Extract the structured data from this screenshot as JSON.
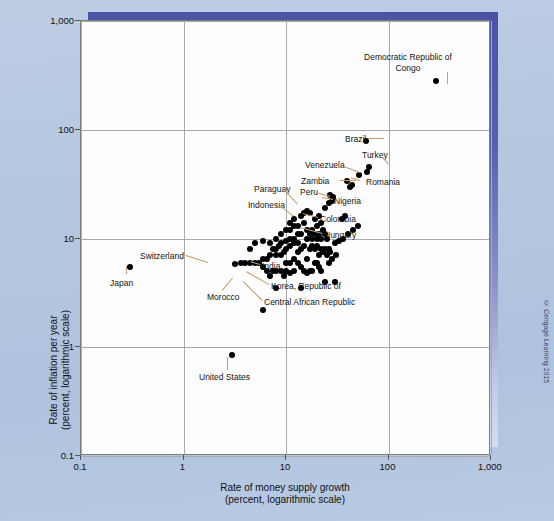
{
  "figure": {
    "copyright": "© Cengage Learning 2015"
  },
  "chart_data": {
    "type": "scatter",
    "title": "",
    "xlabel": "Rate of money supply growth\n(percent, logarithmic scale)",
    "xlabel_line1": "Rate of money supply growth",
    "xlabel_line2": "(percent, logarithmic scale)",
    "ylabel_line1": "Rate of inflation per year",
    "ylabel_line2": "(percent, logarithmic scale)",
    "xscale": "log",
    "yscale": "log",
    "xlim": [
      0.1,
      1000
    ],
    "ylim": [
      0.1,
      1000
    ],
    "grid": true,
    "legend": "none",
    "xticks": [
      "0.1",
      "1",
      "10",
      "100",
      "1,000"
    ],
    "xtick_values": [
      0.1,
      1,
      10,
      100,
      1000
    ],
    "yticks": [
      "1,000",
      "100",
      "10",
      "1",
      "0.1"
    ],
    "ytick_values": [
      1000,
      100,
      10,
      1,
      0.1
    ],
    "labeled_points": [
      {
        "name": "Democratic Republic of Congo",
        "x": 290,
        "y": 280
      },
      {
        "name": "Brazil",
        "x": 61,
        "y": 78
      },
      {
        "name": "Turkey",
        "x": 64,
        "y": 45
      },
      {
        "name": "Romania",
        "x": 52,
        "y": 38
      },
      {
        "name": "Venezuela",
        "x": 39,
        "y": 34
      },
      {
        "name": "Zambia",
        "x": 42,
        "y": 30
      },
      {
        "name": "Peru",
        "x": 27,
        "y": 25
      },
      {
        "name": "Nigeria",
        "x": 28,
        "y": 22
      },
      {
        "name": "Paraguay",
        "x": 17,
        "y": 17
      },
      {
        "name": "Indonesia",
        "x": 15,
        "y": 14
      },
      {
        "name": "Colombia",
        "x": 21,
        "y": 16
      },
      {
        "name": "Hungary",
        "x": 20,
        "y": 13
      },
      {
        "name": "India",
        "x": 13,
        "y": 7.5
      },
      {
        "name": "Korea, Republic of",
        "x": 16,
        "y": 6.5
      },
      {
        "name": "Central African Republic",
        "x": 9.5,
        "y": 4.5
      },
      {
        "name": "Morocco",
        "x": 7.5,
        "y": 5.0
      },
      {
        "name": "Switzerland",
        "x": 3.6,
        "y": 6.0
      },
      {
        "name": "Japan",
        "x": 0.3,
        "y": 5.5
      },
      {
        "name": "United States",
        "x": 3.0,
        "y": 0.85
      }
    ],
    "annotations": [
      {
        "text": "Democratic Republic of",
        "px": 408,
        "py": 52,
        "align": "center",
        "width": 110
      },
      {
        "text": "Congo",
        "px": 408,
        "py": 63,
        "align": "center",
        "width": 110
      },
      {
        "text": "Brazil",
        "px": 345,
        "py": 134
      },
      {
        "text": "Turkey",
        "px": 362,
        "py": 150
      },
      {
        "text": "Venezuela",
        "px": 305,
        "py": 160
      },
      {
        "text": "Romania",
        "px": 366,
        "py": 177
      },
      {
        "text": "Zambia",
        "px": 301,
        "py": 176
      },
      {
        "text": "Peru",
        "px": 300,
        "py": 187
      },
      {
        "text": "Nigeria",
        "px": 334,
        "py": 196
      },
      {
        "text": "Paraguay",
        "px": 254,
        "py": 184
      },
      {
        "text": "Indonesia",
        "px": 248,
        "py": 200
      },
      {
        "text": "Colombia",
        "px": 320,
        "py": 214
      },
      {
        "text": "Hungary",
        "px": 324,
        "py": 230
      },
      {
        "text": "Switzerland",
        "px": 140,
        "py": 251
      },
      {
        "text": "India",
        "px": 262,
        "py": 261
      },
      {
        "text": "Japan",
        "px": 110,
        "py": 278
      },
      {
        "text": "Korea, Republic of",
        "px": 271,
        "py": 281
      },
      {
        "text": "Morocco",
        "px": 207,
        "py": 292
      },
      {
        "text": "Central African Republic",
        "px": 264,
        "py": 297
      },
      {
        "text": "United States",
        "px": 199,
        "py": 372
      }
    ],
    "points": [
      [
        290,
        280
      ],
      [
        61,
        78
      ],
      [
        64,
        45
      ],
      [
        62,
        41
      ],
      [
        52,
        38
      ],
      [
        39,
        34
      ],
      [
        42,
        30
      ],
      [
        44,
        31
      ],
      [
        27,
        25
      ],
      [
        29,
        24
      ],
      [
        28,
        22
      ],
      [
        26,
        21
      ],
      [
        24,
        19
      ],
      [
        17,
        17
      ],
      [
        15,
        14
      ],
      [
        21,
        16
      ],
      [
        20,
        13
      ],
      [
        19,
        15
      ],
      [
        18,
        12
      ],
      [
        16,
        12
      ],
      [
        22,
        14
      ],
      [
        23,
        12
      ],
      [
        14,
        11
      ],
      [
        13,
        11
      ],
      [
        12,
        10
      ],
      [
        11,
        10
      ],
      [
        10,
        9.5
      ],
      [
        9,
        9
      ],
      [
        8.5,
        8.5
      ],
      [
        8,
        8
      ],
      [
        7.5,
        8
      ],
      [
        16,
        10
      ],
      [
        17,
        11
      ],
      [
        18,
        10
      ],
      [
        19,
        11
      ],
      [
        20,
        10
      ],
      [
        21,
        11
      ],
      [
        22,
        10
      ],
      [
        24,
        11
      ],
      [
        25,
        10
      ],
      [
        13,
        9
      ],
      [
        12,
        9
      ],
      [
        11,
        8.5
      ],
      [
        10,
        8
      ],
      [
        9.5,
        7.5
      ],
      [
        9,
        7
      ],
      [
        8,
        7
      ],
      [
        7,
        7
      ],
      [
        6.5,
        6.5
      ],
      [
        6,
        6.5
      ],
      [
        5.5,
        6
      ],
      [
        5,
        6
      ],
      [
        4.5,
        6
      ],
      [
        4,
        6
      ],
      [
        3.6,
        6
      ],
      [
        3.2,
        5.8
      ],
      [
        13,
        7.5
      ],
      [
        16,
        6.5
      ],
      [
        9.5,
        4.5
      ],
      [
        7.5,
        5
      ],
      [
        0.3,
        5.5
      ],
      [
        3,
        0.85
      ],
      [
        14,
        8
      ],
      [
        15,
        8.5
      ],
      [
        17,
        8
      ],
      [
        18,
        8.5
      ],
      [
        19,
        8
      ],
      [
        20,
        8.5
      ],
      [
        22,
        8
      ],
      [
        24,
        8
      ],
      [
        26,
        8
      ],
      [
        30,
        9
      ],
      [
        33,
        9.5
      ],
      [
        36,
        10
      ],
      [
        40,
        11
      ],
      [
        45,
        12
      ],
      [
        50,
        13
      ],
      [
        13,
        13
      ],
      [
        12,
        13
      ],
      [
        11,
        12
      ],
      [
        10,
        12
      ],
      [
        14,
        16
      ],
      [
        15,
        17
      ],
      [
        16,
        18
      ],
      [
        12,
        15
      ],
      [
        11,
        14
      ],
      [
        19,
        6
      ],
      [
        20,
        6
      ],
      [
        21,
        5.5
      ],
      [
        22,
        5
      ],
      [
        18,
        5
      ],
      [
        17,
        5
      ],
      [
        16,
        4.8
      ],
      [
        15,
        5
      ],
      [
        14,
        5.5
      ],
      [
        12,
        5
      ],
      [
        11,
        4.8
      ],
      [
        10,
        5
      ],
      [
        9,
        5
      ],
      [
        8,
        5
      ],
      [
        7,
        4.5
      ],
      [
        6.5,
        5
      ],
      [
        6,
        5.5
      ],
      [
        14,
        3.5
      ],
      [
        24,
        4
      ],
      [
        30,
        4
      ],
      [
        8,
        3.5
      ],
      [
        6,
        2.2
      ],
      [
        26,
        6
      ],
      [
        28,
        6.5
      ],
      [
        31,
        7
      ],
      [
        10,
        6
      ],
      [
        11,
        6
      ],
      [
        12,
        6.5
      ],
      [
        13,
        6
      ],
      [
        21,
        7
      ],
      [
        23,
        7.5
      ],
      [
        25,
        7
      ],
      [
        27,
        7.5
      ],
      [
        5,
        9
      ],
      [
        4.5,
        8
      ],
      [
        6,
        9.5
      ],
      [
        7,
        9
      ],
      [
        8,
        10
      ],
      [
        9,
        11
      ],
      [
        35,
        15
      ],
      [
        38,
        16
      ]
    ]
  }
}
